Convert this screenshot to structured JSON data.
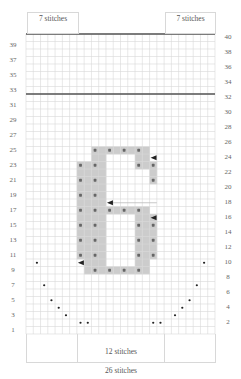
{
  "chart_data": {
    "type": "grid-chart",
    "title": "",
    "grid": {
      "columns": 26,
      "rows": 40,
      "grid_color": "#d9d9d9",
      "thick_line_rows": [
        40,
        32
      ],
      "thick_line_color": "#555555"
    },
    "labels_top": {
      "left": "7 stitches",
      "right": "7 stitches"
    },
    "labels_bottom": {
      "inner": "12 stitches",
      "outer": "26 stitches"
    },
    "row_labels_left": [
      "1",
      "3",
      "5",
      "7",
      "9",
      "11",
      "13",
      "15",
      "17",
      "19",
      "21",
      "23",
      "25",
      "27",
      "29",
      "31",
      "33",
      "35",
      "37",
      "39"
    ],
    "row_labels_right": [
      "2",
      "4",
      "6",
      "8",
      "10",
      "12",
      "14",
      "16",
      "18",
      "20",
      "22",
      "24",
      "26",
      "28",
      "30",
      "32",
      "34",
      "36",
      "38",
      "40"
    ],
    "motif": {
      "name": "6",
      "fill_color": "#cccccc",
      "cells": [
        {
          "row": 25,
          "cols": [
            10,
            11,
            12,
            13,
            14,
            15,
            16,
            17
          ]
        },
        {
          "row": 24,
          "cols": [
            10,
            11,
            16,
            17
          ]
        },
        {
          "row": 23,
          "cols": [
            8,
            9,
            10,
            11,
            16,
            17,
            18
          ]
        },
        {
          "row": 22,
          "cols": [
            8,
            9,
            10,
            11,
            18
          ]
        },
        {
          "row": 21,
          "cols": [
            8,
            9,
            10,
            11,
            18
          ]
        },
        {
          "row": 20,
          "cols": [
            8,
            9,
            10,
            11
          ]
        },
        {
          "row": 19,
          "cols": [
            8,
            9,
            10,
            11
          ]
        },
        {
          "row": 18,
          "cols": [
            8,
            9,
            10,
            11
          ]
        },
        {
          "row": 17,
          "cols": [
            8,
            9,
            10,
            11,
            12,
            13,
            14,
            15,
            16,
            17
          ]
        },
        {
          "row": 16,
          "cols": [
            8,
            9,
            10,
            11,
            16,
            17,
            18
          ]
        },
        {
          "row": 15,
          "cols": [
            8,
            9,
            10,
            11,
            16,
            17,
            18
          ]
        },
        {
          "row": 14,
          "cols": [
            8,
            9,
            10,
            11,
            16,
            17,
            18
          ]
        },
        {
          "row": 13,
          "cols": [
            8,
            9,
            10,
            11,
            16,
            17,
            18
          ]
        },
        {
          "row": 12,
          "cols": [
            8,
            9,
            10,
            11,
            16,
            17,
            18
          ]
        },
        {
          "row": 11,
          "cols": [
            8,
            9,
            10,
            11,
            16,
            17,
            18
          ]
        },
        {
          "row": 10,
          "cols": [
            9,
            10,
            11,
            16,
            17
          ]
        },
        {
          "row": 9,
          "cols": [
            9,
            10,
            11,
            12,
            13,
            14,
            15,
            16,
            17
          ]
        }
      ],
      "dots": [
        [
          25,
          10
        ],
        [
          25,
          12
        ],
        [
          25,
          14
        ],
        [
          25,
          16
        ],
        [
          23,
          8
        ],
        [
          23,
          10
        ],
        [
          23,
          16
        ],
        [
          23,
          18
        ],
        [
          21,
          8
        ],
        [
          21,
          10
        ],
        [
          21,
          18
        ],
        [
          19,
          8
        ],
        [
          19,
          10
        ],
        [
          17,
          8
        ],
        [
          17,
          10
        ],
        [
          17,
          12
        ],
        [
          17,
          14
        ],
        [
          17,
          16
        ],
        [
          15,
          8
        ],
        [
          15,
          10
        ],
        [
          15,
          16
        ],
        [
          15,
          18
        ],
        [
          13,
          8
        ],
        [
          13,
          10
        ],
        [
          13,
          16
        ],
        [
          13,
          18
        ],
        [
          11,
          8
        ],
        [
          11,
          10
        ],
        [
          11,
          16
        ],
        [
          11,
          18
        ],
        [
          9,
          10
        ],
        [
          9,
          12
        ],
        [
          9,
          14
        ],
        [
          9,
          16
        ]
      ],
      "arrows": [
        {
          "row": 24,
          "col": 18,
          "direction": "left"
        },
        {
          "row": 18,
          "col": 12,
          "direction": "left",
          "line_to_col": 18
        },
        {
          "row": 16,
          "col": 18,
          "direction": "left"
        },
        {
          "row": 10,
          "col": 8,
          "direction": "left"
        }
      ]
    },
    "decrease_dots": [
      [
        10,
        2
      ],
      [
        7,
        3
      ],
      [
        5,
        4
      ],
      [
        4,
        5
      ],
      [
        3,
        6
      ],
      [
        2,
        8
      ],
      [
        2,
        9
      ],
      [
        2,
        18
      ],
      [
        2,
        19
      ],
      [
        3,
        21
      ],
      [
        4,
        22
      ],
      [
        5,
        23
      ],
      [
        7,
        24
      ],
      [
        10,
        25
      ]
    ]
  }
}
